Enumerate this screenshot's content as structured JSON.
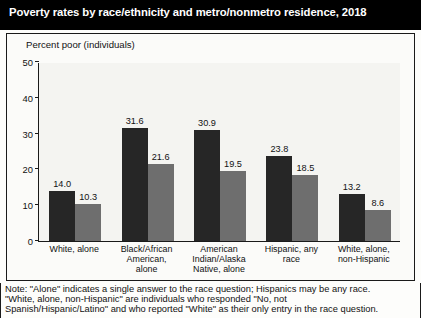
{
  "title": "Poverty rates by race/ethnicity and metro/nonmetro residence, 2018",
  "axis_title": "Percent poor (individuals)",
  "legend": {
    "nonmetro_label": "Nonmetro",
    "metro_label": "Metro",
    "nonmetro_color": "#262626",
    "metro_color": "#6e6e6e"
  },
  "notes": {
    "line1": "Note: \"Alone\" indicates a single answer to the race question; Hispanics may be any race.",
    "line2": "\"White, alone, non-Hispanic\" are individuals who responded \"No, not",
    "line3": "Spanish/Hispanic/Latino\" and who reported \"White\" as their only entry in the race question."
  },
  "chart_data": {
    "type": "bar",
    "title": "Poverty rates by race/ethnicity and metro/nonmetro residence, 2018",
    "xlabel": "",
    "ylabel": "Percent poor (individuals)",
    "ylim": [
      0,
      50
    ],
    "yticks": [
      0,
      10,
      20,
      30,
      40,
      50
    ],
    "grid": false,
    "legend_position": "top-right",
    "categories": [
      "White, alone",
      "Black/African American, alone",
      "American Indian/Alaska Native, alone",
      "Hispanic, any race",
      "White, alone, non-Hispanic"
    ],
    "category_lines": [
      [
        "White, alone"
      ],
      [
        "Black/African",
        "American,",
        "alone"
      ],
      [
        "American",
        "Indian/Alaska",
        "Native, alone"
      ],
      [
        "Hispanic, any",
        "race"
      ],
      [
        "White, alone,",
        "non-Hispanic"
      ]
    ],
    "series": [
      {
        "name": "Nonmetro",
        "color": "#262626",
        "values": [
          14.0,
          31.6,
          30.9,
          23.8,
          13.2
        ]
      },
      {
        "name": "Metro",
        "color": "#6e6e6e",
        "values": [
          10.3,
          21.6,
          19.5,
          18.5,
          8.6
        ]
      }
    ],
    "value_labels": [
      [
        "14.0",
        "10.3"
      ],
      [
        "31.6",
        "21.6"
      ],
      [
        "30.9",
        "19.5"
      ],
      [
        "23.8",
        "18.5"
      ],
      [
        "13.2",
        "8.6"
      ]
    ]
  }
}
